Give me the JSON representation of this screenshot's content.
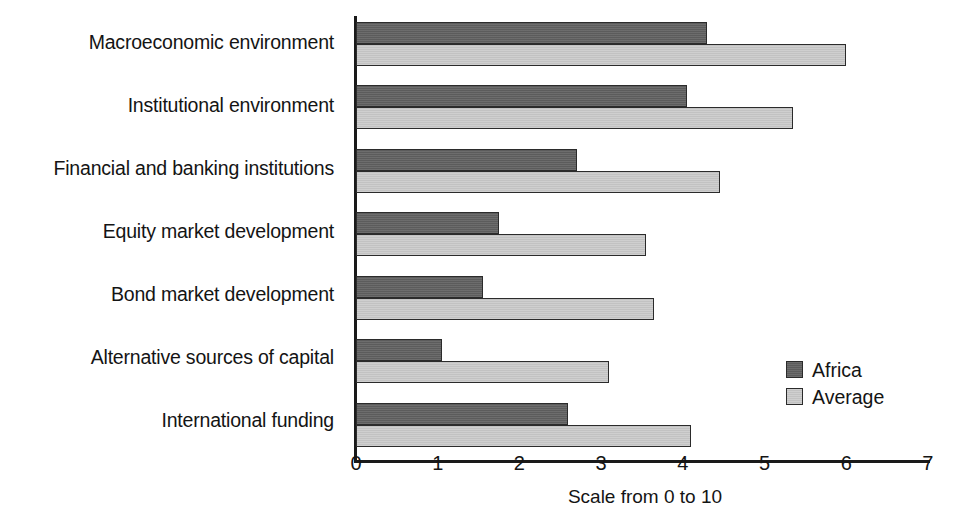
{
  "chart_data": {
    "type": "bar",
    "orientation": "horizontal",
    "title": "",
    "xlabel": "Scale from 0 to 10",
    "ylabel": "",
    "xlim": [
      0,
      7
    ],
    "xticks": [
      "0",
      "1",
      "2",
      "3",
      "4",
      "5",
      "6",
      "7"
    ],
    "grid": false,
    "legend_position": "center-right",
    "categories": [
      "Macroeconomic environment",
      "Institutional environment",
      "Financial and banking institutions",
      "Equity market development",
      "Bond market development",
      "Alternative sources of capital",
      "International funding"
    ],
    "series": [
      {
        "name": "Africa",
        "color": "#5c5c5c",
        "values": [
          4.3,
          4.05,
          2.7,
          1.75,
          1.55,
          1.05,
          2.6
        ]
      },
      {
        "name": "Average",
        "color": "#c2c2c2",
        "values": [
          6.0,
          5.35,
          4.45,
          3.55,
          3.65,
          3.1,
          4.1
        ]
      }
    ]
  },
  "legend": {
    "items": [
      {
        "label": "Africa",
        "swatch": "dark-gray-swatch"
      },
      {
        "label": "Average",
        "swatch": "light-gray-swatch"
      }
    ]
  }
}
